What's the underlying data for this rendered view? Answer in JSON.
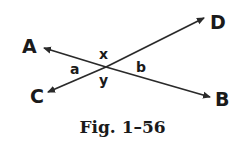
{
  "figure": {
    "caption": "Fig. 1–56",
    "points": {
      "A": "A",
      "B": "B",
      "C": "C",
      "D": "D"
    },
    "angles": {
      "x": "x",
      "y": "y",
      "a": "a",
      "b": "b"
    },
    "lines": [
      {
        "name": "AB",
        "from": "A",
        "to": "B",
        "arrows": "both"
      },
      {
        "name": "CD",
        "from": "C",
        "to": "D",
        "arrows": "both"
      }
    ],
    "line_color": "#2a2a2a"
  }
}
